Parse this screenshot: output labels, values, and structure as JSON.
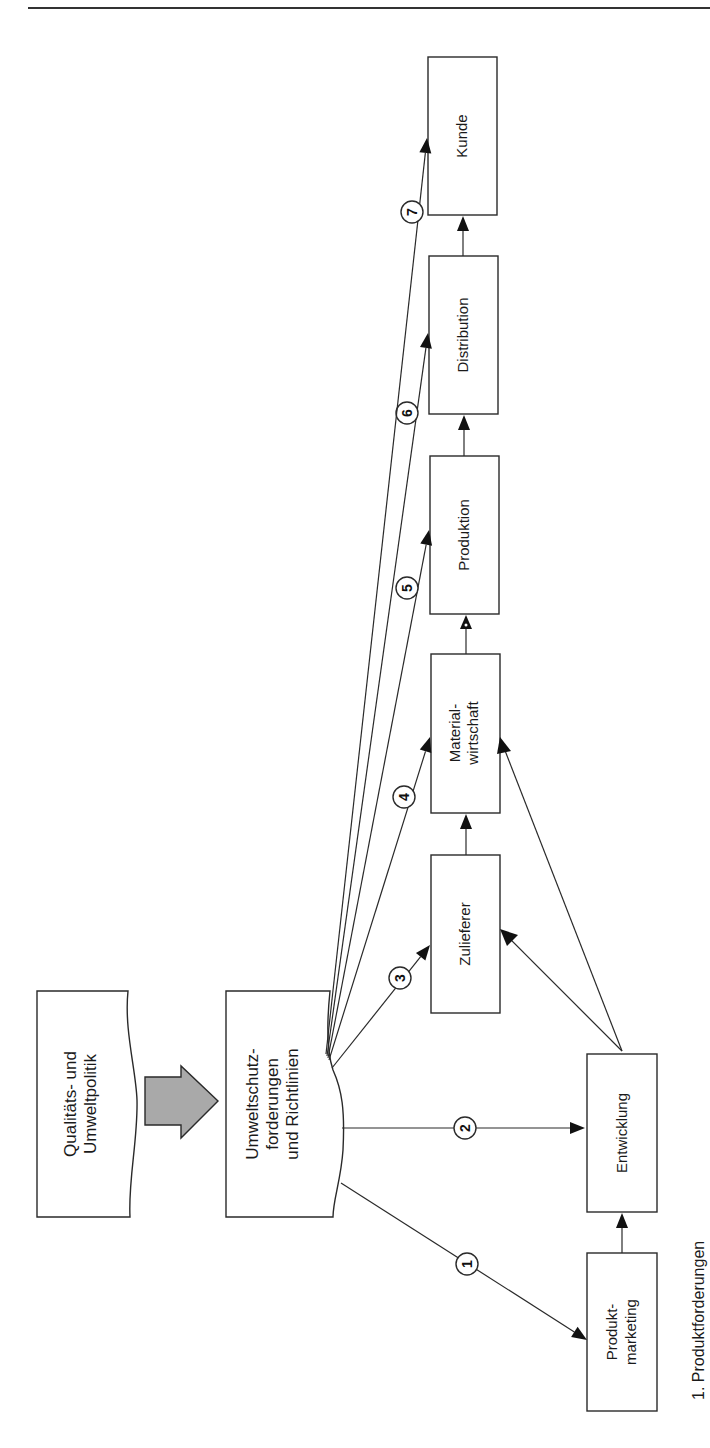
{
  "page": {
    "header_text": "",
    "caption": "1. Produktforderungen"
  },
  "diagram": {
    "source_boxes": {
      "policy": {
        "lines": [
          "Qualitäts- und",
          "Umweltpolitik"
        ]
      },
      "requirements": {
        "lines": [
          "Umweltschutz-",
          "forderungen",
          "und Richtlinien"
        ]
      }
    },
    "boxes": {
      "kunde": {
        "lines": [
          "Kunde"
        ]
      },
      "distribution": {
        "lines": [
          "Distribution"
        ]
      },
      "produktion": {
        "lines": [
          "Produktion"
        ]
      },
      "materialwirtschaft": {
        "lines": [
          "Material-",
          "wirtschaft"
        ]
      },
      "zulieferer": {
        "lines": [
          "Zulieferer"
        ]
      },
      "entwicklung": {
        "lines": [
          "Entwicklung"
        ]
      },
      "produktmarketing": {
        "lines": [
          "Produkt-",
          "marketing"
        ]
      }
    },
    "requirement_flows": [
      {
        "number": "1",
        "target": "Produktmarketing"
      },
      {
        "number": "2",
        "target": "Entwicklung"
      },
      {
        "number": "3",
        "target": "Zulieferer"
      },
      {
        "number": "4",
        "target": "Materialwirtschaft"
      },
      {
        "number": "5",
        "target": "Produktion"
      },
      {
        "number": "6",
        "target": "Distribution"
      },
      {
        "number": "7",
        "target": "Kunde"
      }
    ],
    "process_chain": [
      "Produktmarketing",
      "Entwicklung",
      "Zulieferer",
      "Materialwirtschaft",
      "Produktion",
      "Distribution",
      "Kunde"
    ],
    "colors": {
      "big_arrow_fill": "#a9a9a9",
      "line": "#2a2a2a"
    }
  }
}
